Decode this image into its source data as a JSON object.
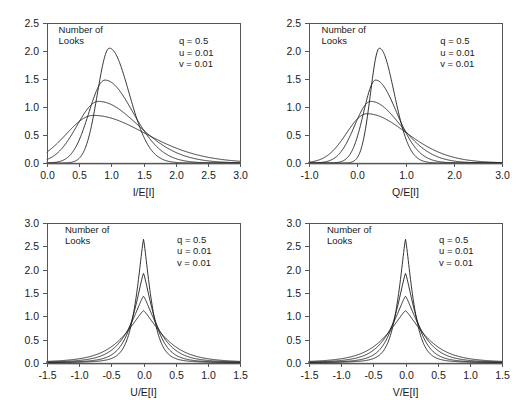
{
  "figure": {
    "background": "#ffffff",
    "curve_color": "#1d1d1d",
    "axis_color": "#55565a"
  },
  "chart_data": [
    {
      "id": "panel-i",
      "type": "line",
      "title": "",
      "xlabel": "I/E[I]",
      "ylabel": "",
      "xlim": [
        0.0,
        3.0
      ],
      "ylim": [
        0.0,
        2.5
      ],
      "xticks": [
        0.0,
        0.5,
        1.0,
        1.5,
        2.0,
        2.5,
        3.0
      ],
      "xticklabels": [
        "0.0",
        "0.5",
        "1.0",
        "1.5",
        "2.0",
        "2.5",
        "3.0"
      ],
      "yticks": [
        0.0,
        0.5,
        1.0,
        1.5,
        2.0,
        2.5
      ],
      "yticklabels": [
        "0.0",
        "0.5",
        "1.0",
        "1.5",
        "2.0",
        "2.5"
      ],
      "grid": false,
      "legend": "none",
      "annotations": [
        {
          "name": "number-of-looks-label",
          "lines": [
            "Number of",
            "Looks"
          ],
          "x": 0.18,
          "y": 2.33
        },
        {
          "name": "parameter-block",
          "lines": [
            "q = 0.5",
            "u = 0.01",
            "v = 0.01"
          ],
          "x": 2.05,
          "y": 2.12
        }
      ],
      "series": [
        {
          "name": "looks-8",
          "peak_x": 0.97,
          "peak_y": 2.05,
          "shape": "skewed",
          "spread": 0.21,
          "skew": 0.42
        },
        {
          "name": "looks-4",
          "peak_x": 0.9,
          "peak_y": 1.48,
          "shape": "skewed",
          "spread": 0.29,
          "skew": 0.5
        },
        {
          "name": "looks-2",
          "peak_x": 0.8,
          "peak_y": 1.1,
          "shape": "skewed",
          "spread": 0.4,
          "skew": 0.58
        },
        {
          "name": "looks-1",
          "peak_x": 0.72,
          "peak_y": 0.85,
          "shape": "skewed",
          "spread": 0.52,
          "skew": 0.66
        }
      ]
    },
    {
      "id": "panel-q",
      "type": "line",
      "title": "",
      "xlabel": "Q/E[I]",
      "ylabel": "",
      "xlim": [
        -1.0,
        3.0
      ],
      "ylim": [
        0.0,
        2.5
      ],
      "xticks": [
        -1.0,
        0.0,
        1.0,
        2.0,
        3.0
      ],
      "xticklabels": [
        "-1.0",
        "0.0",
        "1.0",
        "2.0",
        "3.0"
      ],
      "yticks": [
        0.0,
        0.5,
        1.0,
        1.5,
        2.0,
        2.5
      ],
      "yticklabels": [
        "0.0",
        "0.5",
        "1.0",
        "1.5",
        "2.0",
        "2.5"
      ],
      "grid": false,
      "legend": "none",
      "annotations": [
        {
          "name": "number-of-looks-label",
          "lines": [
            "Number of",
            "Looks"
          ],
          "x": -0.74,
          "y": 2.33
        },
        {
          "name": "parameter-block",
          "lines": [
            "q = 0.5",
            "u = 0.01",
            "v = 0.01"
          ],
          "x": 1.72,
          "y": 2.12
        }
      ],
      "series": [
        {
          "name": "looks-8",
          "peak_x": 0.46,
          "peak_y": 2.05,
          "shape": "skewed",
          "spread": 0.21,
          "skew": 0.42
        },
        {
          "name": "looks-4",
          "peak_x": 0.38,
          "peak_y": 1.48,
          "shape": "skewed",
          "spread": 0.29,
          "skew": 0.5
        },
        {
          "name": "looks-2",
          "peak_x": 0.28,
          "peak_y": 1.1,
          "shape": "skewed",
          "spread": 0.4,
          "skew": 0.58
        },
        {
          "name": "looks-1",
          "peak_x": 0.2,
          "peak_y": 0.88,
          "shape": "skewed",
          "spread": 0.52,
          "skew": 0.66
        }
      ]
    },
    {
      "id": "panel-u",
      "type": "line",
      "title": "",
      "xlabel": "U/E[I]",
      "ylabel": "",
      "xlim": [
        -1.5,
        1.5
      ],
      "ylim": [
        0.0,
        3.0
      ],
      "xticks": [
        -1.5,
        -1.0,
        -0.5,
        0.0,
        0.5,
        1.0,
        1.5
      ],
      "xticklabels": [
        "-1.5",
        "-1.0",
        "-0.5",
        "0.0",
        "0.5",
        "1.0",
        "1.5"
      ],
      "yticks": [
        0.0,
        0.5,
        1.0,
        1.5,
        2.0,
        2.5,
        3.0
      ],
      "yticklabels": [
        "0.0",
        "0.5",
        "1.0",
        "1.5",
        "2.0",
        "2.5",
        "3.0"
      ],
      "grid": false,
      "legend": "none",
      "annotations": [
        {
          "name": "number-of-looks-label",
          "lines": [
            "Number of",
            "Looks"
          ],
          "x": -1.22,
          "y": 2.79
        },
        {
          "name": "parameter-block",
          "lines": [
            "q = 0.5",
            "u = 0.01",
            "v = 0.01"
          ],
          "x": 0.52,
          "y": 2.58
        }
      ],
      "series": [
        {
          "name": "looks-8",
          "peak_x": 0.0,
          "peak_y": 2.65,
          "shape": "peaked",
          "spread": 0.145,
          "tail": 0.3
        },
        {
          "name": "looks-4",
          "peak_x": 0.0,
          "peak_y": 1.92,
          "shape": "peaked",
          "spread": 0.195,
          "tail": 0.38
        },
        {
          "name": "looks-2",
          "peak_x": 0.0,
          "peak_y": 1.43,
          "shape": "peaked",
          "spread": 0.265,
          "tail": 0.47
        },
        {
          "name": "looks-1",
          "peak_x": 0.0,
          "peak_y": 1.12,
          "shape": "peaked",
          "spread": 0.345,
          "tail": 0.56
        }
      ]
    },
    {
      "id": "panel-v",
      "type": "line",
      "title": "",
      "xlabel": "V/E[I]",
      "ylabel": "",
      "xlim": [
        -1.5,
        1.5
      ],
      "ylim": [
        0.0,
        3.0
      ],
      "xticks": [
        -1.5,
        -1.0,
        -0.5,
        0.0,
        0.5,
        1.0,
        1.5
      ],
      "xticklabels": [
        "-1.5",
        "-1.0",
        "-0.5",
        "0.0",
        "0.5",
        "1.0",
        "1.5"
      ],
      "yticks": [
        0.0,
        0.5,
        1.0,
        1.5,
        2.0,
        2.5,
        3.0
      ],
      "yticklabels": [
        "0.0",
        "0.5",
        "1.0",
        "1.5",
        "2.0",
        "2.5",
        "3.0"
      ],
      "grid": false,
      "legend": "none",
      "annotations": [
        {
          "name": "number-of-looks-label",
          "lines": [
            "Number of",
            "Looks"
          ],
          "x": -1.22,
          "y": 2.79
        },
        {
          "name": "parameter-block",
          "lines": [
            "q = 0.5",
            "u = 0.01",
            "v = 0.01"
          ],
          "x": 0.52,
          "y": 2.58
        }
      ],
      "series": [
        {
          "name": "looks-8",
          "peak_x": 0.0,
          "peak_y": 2.65,
          "shape": "peaked",
          "spread": 0.145,
          "tail": 0.3
        },
        {
          "name": "looks-4",
          "peak_x": 0.0,
          "peak_y": 1.92,
          "shape": "peaked",
          "spread": 0.195,
          "tail": 0.38
        },
        {
          "name": "looks-2",
          "peak_x": 0.0,
          "peak_y": 1.43,
          "shape": "peaked",
          "spread": 0.265,
          "tail": 0.47
        },
        {
          "name": "looks-1",
          "peak_x": 0.0,
          "peak_y": 1.12,
          "shape": "peaked",
          "spread": 0.345,
          "tail": 0.56
        }
      ]
    }
  ],
  "layout": {
    "panels": [
      {
        "id": "panel-i",
        "left": 0,
        "top": 0,
        "width": 262,
        "height": 200
      },
      {
        "id": "panel-q",
        "left": 262,
        "top": 0,
        "width": 262,
        "height": 200
      },
      {
        "id": "panel-u",
        "left": 0,
        "top": 200,
        "width": 262,
        "height": 200
      },
      {
        "id": "panel-v",
        "left": 262,
        "top": 200,
        "width": 262,
        "height": 200
      }
    ],
    "plot_box": {
      "left": 47,
      "top": 23,
      "right": 240,
      "bottom": 163
    }
  }
}
